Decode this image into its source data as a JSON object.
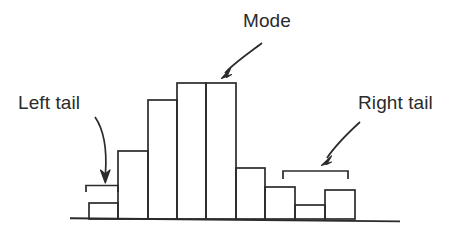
{
  "figure": {
    "title_visible": false,
    "background_color": "#ffffff",
    "stroke_color": "#2b2b2b",
    "baseline": {
      "x1": 70,
      "x2": 400,
      "y": 219
    }
  },
  "annotations": {
    "mode": {
      "label": "Mode",
      "icon": "curved-arrow-icon",
      "points_to": "tallest-bars"
    },
    "left_tail": {
      "label": "Left tail",
      "icon": "curved-arrow-icon",
      "points_to": "left-bracket"
    },
    "right_tail": {
      "label": "Right tail",
      "icon": "curved-arrow-icon",
      "points_to": "right-bracket"
    }
  },
  "brackets": {
    "left": {
      "name": "left-tail-bracket",
      "x1": 86,
      "x2": 118,
      "y": 185,
      "tick_height": 7
    },
    "right": {
      "name": "right-tail-bracket",
      "x1": 283,
      "x2": 348,
      "y": 171,
      "tick_height": 8
    }
  },
  "chart_data": {
    "type": "bar",
    "title": "",
    "subtitle": "",
    "xlabel": "",
    "ylabel": "",
    "grid": false,
    "legend": false,
    "axis_style": "baseline-only",
    "categories": [
      "1",
      "2",
      "3",
      "4",
      "5",
      "6",
      "7",
      "8",
      "9",
      "10",
      "11"
    ],
    "values": [
      0,
      16,
      68,
      119,
      136,
      136,
      51,
      32,
      14,
      0,
      29
    ],
    "ylim": [
      0,
      145
    ],
    "bar_left_edges": [
      60,
      89,
      118,
      148,
      177,
      206,
      236,
      265,
      295,
      325,
      325
    ],
    "bar_width": 29,
    "bars": [
      {
        "name": "bar-1",
        "x": 89,
        "width": 29,
        "height": 16,
        "top": 203
      },
      {
        "name": "bar-2",
        "x": 118,
        "width": 30,
        "height": 68,
        "top": 151
      },
      {
        "name": "bar-3",
        "x": 148,
        "width": 29,
        "height": 119,
        "top": 100
      },
      {
        "name": "bar-4",
        "x": 177,
        "width": 29,
        "height": 136,
        "top": 83
      },
      {
        "name": "bar-5",
        "x": 206,
        "width": 30,
        "height": 136,
        "top": 83
      },
      {
        "name": "bar-6",
        "x": 236,
        "width": 29,
        "height": 51,
        "top": 168
      },
      {
        "name": "bar-7",
        "x": 265,
        "width": 30,
        "height": 32,
        "top": 187
      },
      {
        "name": "bar-8",
        "x": 295,
        "width": 30,
        "height": 14,
        "top": 205
      },
      {
        "name": "bar-9",
        "x": 325,
        "width": 30,
        "height": 29,
        "top": 190
      }
    ],
    "annotations": [
      "Mode",
      "Left tail",
      "Right tail"
    ]
  }
}
